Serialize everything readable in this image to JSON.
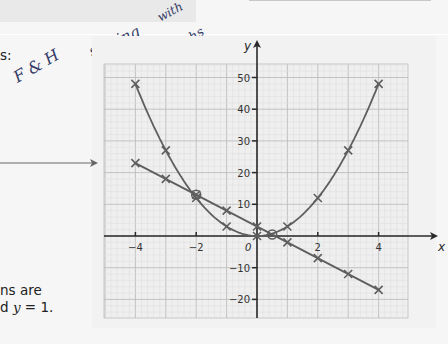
{
  "page": {
    "left_text": {
      "line1": "s:",
      "line2": "ns are",
      "line3_prefix": "d ",
      "line3_var": "y",
      "line3_suffix": " = 1."
    },
    "handwriting": {
      "note1": "F & H",
      "note2": "solving",
      "note3": "with",
      "note4": "graphs"
    }
  },
  "chart_data": {
    "type": "line",
    "title": "",
    "xlabel": "x",
    "ylabel": "y",
    "origin_label": "0",
    "xlim": [
      -5,
      5
    ],
    "ylim": [
      -25,
      55
    ],
    "x_ticks": [
      -4,
      -2,
      2,
      4
    ],
    "x_tick_labels": [
      "−4",
      "−2",
      "2",
      "4"
    ],
    "y_ticks": [
      50,
      40,
      30,
      20,
      10,
      -10,
      -20
    ],
    "y_tick_labels": [
      "50",
      "40",
      "30",
      "20",
      "10",
      "−10",
      "−20"
    ],
    "grid": true,
    "x": [
      -4,
      -3,
      -2,
      -1,
      0,
      1,
      2,
      3,
      4
    ],
    "series": [
      {
        "name": "y = 3x²",
        "values": [
          48,
          27,
          12,
          3,
          0,
          3,
          12,
          27,
          48
        ],
        "marker": "x",
        "curve": "parabola"
      },
      {
        "name": "y = 3 − 5x",
        "values": [
          23,
          18,
          13,
          8,
          3,
          -2,
          -7,
          -12,
          -17
        ],
        "marker": "x",
        "curve": "straight"
      }
    ],
    "intersections": [
      {
        "x": -2,
        "y": 13
      },
      {
        "x": 0.5,
        "y": 0.5
      }
    ],
    "colors": {
      "grid_minor": "#dcdcdc",
      "grid_major": "#bdbdbd",
      "axis": "#2a2a2a",
      "curve": "#5e5e5e",
      "grid_bg": "#efefef"
    }
  }
}
